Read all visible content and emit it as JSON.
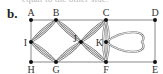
{
  "top_text_cutoff": "equal to the other side.",
  "part_label": "b.",
  "graph": {
    "nodes": [
      {
        "id": "A",
        "label": "A"
      },
      {
        "id": "B",
        "label": "B"
      },
      {
        "id": "C",
        "label": "C"
      },
      {
        "id": "D",
        "label": "D"
      },
      {
        "id": "E",
        "label": "E"
      },
      {
        "id": "F",
        "label": "F"
      },
      {
        "id": "G",
        "label": "G"
      },
      {
        "id": "H",
        "label": "H"
      },
      {
        "id": "I",
        "label": "I"
      },
      {
        "id": "J",
        "label": "J"
      },
      {
        "id": "K",
        "label": "K"
      }
    ],
    "straight_edges": [
      [
        "A",
        "B"
      ],
      [
        "B",
        "C"
      ],
      [
        "C",
        "D"
      ],
      [
        "D",
        "E"
      ],
      [
        "E",
        "F"
      ],
      [
        "F",
        "G"
      ],
      [
        "G",
        "H"
      ],
      [
        "H",
        "I"
      ],
      [
        "I",
        "A"
      ],
      [
        "C",
        "K"
      ],
      [
        "K",
        "F"
      ]
    ],
    "double_curved_edges": [
      [
        "I",
        "B"
      ],
      [
        "I",
        "G"
      ],
      [
        "B",
        "J"
      ],
      [
        "G",
        "J"
      ],
      [
        "J",
        "C"
      ],
      [
        "J",
        "F"
      ],
      [
        "C",
        "F"
      ]
    ],
    "loops": [
      "K"
    ]
  }
}
